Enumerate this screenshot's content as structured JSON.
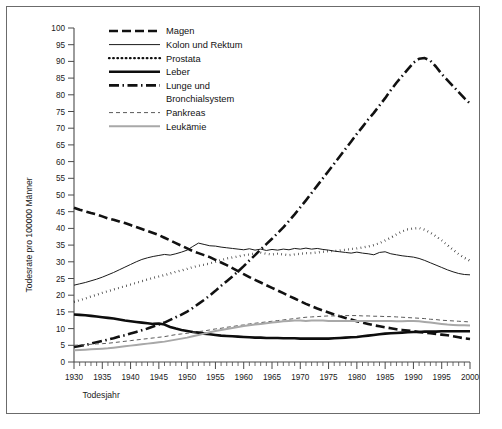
{
  "chart_data": {
    "type": "line",
    "title": "",
    "xlabel": "Todesjahr",
    "ylabel": "Todesrate pro 100000 Männer",
    "xlim": [
      1930,
      2000
    ],
    "ylim": [
      0,
      100
    ],
    "ytick_step": 5,
    "xtick_step": 5,
    "xminor_step": 1,
    "grid": false,
    "legend_position": "top-left-inside",
    "x": [
      1930,
      1931,
      1932,
      1933,
      1934,
      1935,
      1936,
      1937,
      1938,
      1939,
      1940,
      1941,
      1942,
      1943,
      1944,
      1945,
      1946,
      1947,
      1948,
      1949,
      1950,
      1951,
      1952,
      1953,
      1954,
      1955,
      1956,
      1957,
      1958,
      1959,
      1960,
      1961,
      1962,
      1963,
      1964,
      1965,
      1966,
      1967,
      1968,
      1969,
      1970,
      1971,
      1972,
      1973,
      1974,
      1975,
      1976,
      1977,
      1978,
      1979,
      1980,
      1981,
      1982,
      1983,
      1984,
      1985,
      1986,
      1987,
      1988,
      1989,
      1990,
      1991,
      1992,
      1993,
      1994,
      1995,
      1996,
      1997,
      1998,
      1999,
      2000
    ],
    "xticklabels": [
      "1930",
      "1935",
      "1940",
      "1945",
      "1950",
      "1955",
      "1960",
      "1965",
      "1970",
      "1975",
      "1980",
      "1985",
      "1990",
      "1995",
      "2000"
    ],
    "yticklabels": [
      "0",
      "5",
      "10",
      "15",
      "20",
      "25",
      "30",
      "35",
      "40",
      "45",
      "50",
      "55",
      "60",
      "65",
      "70",
      "75",
      "80",
      "85",
      "90",
      "95",
      "100"
    ],
    "series": [
      {
        "name": "Magen",
        "style": "dashed",
        "color": "#111111",
        "width": 2.6,
        "dash": "9,4",
        "values": [
          46.2,
          45.6,
          45.1,
          44.6,
          44.2,
          43.6,
          43.0,
          42.6,
          42.1,
          41.6,
          41.0,
          40.4,
          39.8,
          39.2,
          38.6,
          38.0,
          37.2,
          36.4,
          35.6,
          34.8,
          34.0,
          33.2,
          32.6,
          32.0,
          31.4,
          30.6,
          29.8,
          29.0,
          28.1,
          27.2,
          26.3,
          25.4,
          24.6,
          23.8,
          23.0,
          22.2,
          21.4,
          20.6,
          19.8,
          19.0,
          18.2,
          17.4,
          16.7,
          16.0,
          15.4,
          14.8,
          14.2,
          13.7,
          13.2,
          12.7,
          12.2,
          11.8,
          11.4,
          11.0,
          10.7,
          10.4,
          10.1,
          9.8,
          9.6,
          9.4,
          9.2,
          9.0,
          8.8,
          8.6,
          8.4,
          8.2,
          8.0,
          7.7,
          7.4,
          7.1,
          6.9
        ]
      },
      {
        "name": "Kolon und Rektum",
        "style": "solid-thin",
        "color": "#1a1a1a",
        "width": 1.0,
        "dash": "",
        "values": [
          23.0,
          23.4,
          23.8,
          24.3,
          24.8,
          25.4,
          26.1,
          26.8,
          27.6,
          28.4,
          29.2,
          30.0,
          30.7,
          31.2,
          31.6,
          31.9,
          32.2,
          32.0,
          32.4,
          32.9,
          33.5,
          34.6,
          35.6,
          35.2,
          34.8,
          34.7,
          34.4,
          34.2,
          34.0,
          33.8,
          33.6,
          33.9,
          33.5,
          33.8,
          33.4,
          33.7,
          33.5,
          33.8,
          33.6,
          34.0,
          33.8,
          34.1,
          33.8,
          34.0,
          33.7,
          33.5,
          33.2,
          33.0,
          32.8,
          32.6,
          32.9,
          32.6,
          32.4,
          32.1,
          32.8,
          33.0,
          32.4,
          32.1,
          31.8,
          31.6,
          31.4,
          31.0,
          30.4,
          29.7,
          29.0,
          28.3,
          27.6,
          27.0,
          26.5,
          26.2,
          26.1
        ]
      },
      {
        "name": "Prostata",
        "style": "dotted",
        "color": "#111111",
        "width": 2.3,
        "dash": "0.6,3.6",
        "values": [
          18.0,
          18.5,
          19.0,
          19.6,
          20.1,
          20.7,
          21.2,
          21.7,
          22.2,
          22.7,
          23.2,
          23.7,
          24.2,
          24.7,
          25.2,
          25.6,
          26.0,
          26.5,
          27.0,
          27.4,
          27.9,
          28.4,
          28.8,
          29.1,
          29.5,
          30.0,
          30.5,
          31.0,
          31.3,
          31.6,
          32.0,
          32.2,
          32.5,
          32.7,
          32.4,
          32.2,
          32.4,
          32.2,
          32.0,
          32.2,
          32.4,
          32.6,
          32.6,
          32.8,
          33.0,
          33.2,
          33.2,
          33.4,
          33.6,
          33.8,
          34.0,
          34.3,
          34.6,
          35.0,
          35.6,
          36.4,
          37.2,
          38.2,
          39.1,
          39.7,
          40.0,
          40.1,
          39.6,
          38.7,
          37.6,
          36.4,
          35.0,
          33.6,
          32.3,
          31.2,
          30.3
        ]
      },
      {
        "name": "Leber",
        "style": "solid-thick",
        "color": "#0d0d0d",
        "width": 2.6,
        "dash": "",
        "values": [
          14.2,
          14.1,
          14.0,
          13.8,
          13.6,
          13.4,
          13.2,
          13.0,
          12.7,
          12.4,
          12.2,
          12.0,
          11.8,
          11.6,
          11.4,
          11.5,
          11.2,
          10.5,
          10.0,
          9.6,
          9.3,
          9.0,
          8.8,
          8.5,
          8.3,
          8.1,
          7.9,
          7.8,
          7.7,
          7.6,
          7.5,
          7.4,
          7.3,
          7.3,
          7.2,
          7.2,
          7.2,
          7.1,
          7.1,
          7.1,
          7.0,
          7.0,
          7.0,
          7.0,
          7.0,
          7.0,
          7.1,
          7.2,
          7.3,
          7.4,
          7.5,
          7.7,
          7.9,
          8.1,
          8.3,
          8.5,
          8.6,
          8.7,
          8.8,
          8.9,
          9.0,
          9.0,
          9.1,
          9.1,
          9.1,
          9.2,
          9.2,
          9.2,
          9.2,
          9.2,
          9.2
        ]
      },
      {
        "name": "Lunge und Bronchialsystem",
        "style": "dashdot",
        "color": "#111111",
        "width": 2.6,
        "dash": "10,3.5,1.5,3.5",
        "values": [
          4.5,
          4.8,
          5.1,
          5.5,
          5.9,
          6.3,
          6.7,
          7.1,
          7.6,
          8.0,
          8.5,
          9.0,
          9.5,
          10.0,
          10.6,
          11.2,
          11.8,
          12.6,
          13.4,
          14.2,
          15.1,
          16.2,
          17.4,
          18.6,
          19.9,
          21.3,
          22.8,
          24.2,
          25.6,
          27.1,
          28.7,
          30.4,
          32.0,
          33.7,
          35.3,
          36.9,
          38.6,
          40.3,
          42.2,
          44.2,
          46.3,
          48.4,
          50.6,
          52.8,
          55.0,
          57.2,
          59.4,
          61.6,
          63.8,
          66.0,
          68.3,
          70.4,
          72.6,
          74.6,
          76.8,
          79.0,
          81.4,
          83.6,
          85.6,
          87.6,
          89.6,
          90.8,
          91.0,
          90.2,
          88.4,
          86.2,
          84.4,
          82.6,
          80.8,
          79.0,
          77.4
        ]
      },
      {
        "name": "Pankreas",
        "style": "dashed-thin",
        "color": "#5a5a5a",
        "width": 1.0,
        "dash": "4,3",
        "values": [
          5.0,
          5.1,
          5.2,
          5.3,
          5.4,
          5.5,
          5.6,
          5.8,
          6.0,
          6.2,
          6.4,
          6.6,
          6.8,
          7.0,
          7.2,
          7.4,
          7.6,
          7.9,
          8.2,
          8.4,
          8.6,
          8.9,
          9.1,
          9.3,
          9.6,
          9.9,
          10.1,
          10.4,
          10.6,
          10.9,
          11.1,
          11.4,
          11.6,
          11.8,
          12.0,
          12.2,
          12.4,
          12.6,
          12.8,
          13.0,
          13.2,
          13.4,
          13.5,
          13.6,
          13.7,
          13.8,
          13.8,
          13.9,
          13.9,
          13.9,
          13.9,
          13.8,
          13.8,
          13.7,
          13.7,
          13.6,
          13.6,
          13.5,
          13.4,
          13.3,
          13.2,
          13.1,
          13.0,
          12.8,
          12.7,
          12.5,
          12.4,
          12.3,
          12.2,
          12.1,
          12.0
        ]
      },
      {
        "name": "Leukämie",
        "style": "solid-gray",
        "color": "#a8a8a8",
        "width": 2.0,
        "dash": "",
        "values": [
          3.5,
          3.6,
          3.7,
          3.8,
          3.9,
          4.0,
          4.1,
          4.3,
          4.5,
          4.7,
          4.9,
          5.1,
          5.3,
          5.5,
          5.7,
          5.9,
          6.1,
          6.4,
          6.7,
          7.0,
          7.3,
          7.7,
          8.1,
          8.5,
          8.9,
          9.3,
          9.6,
          9.9,
          10.2,
          10.5,
          10.8,
          11.0,
          11.2,
          11.4,
          11.6,
          11.8,
          12.0,
          12.2,
          12.3,
          12.4,
          12.4,
          12.3,
          12.4,
          12.4,
          12.4,
          12.3,
          12.3,
          12.3,
          12.3,
          12.3,
          12.3,
          12.3,
          12.3,
          12.3,
          12.3,
          12.3,
          12.3,
          12.2,
          12.2,
          12.3,
          12.3,
          12.2,
          12.0,
          11.8,
          11.6,
          11.4,
          11.2,
          11.1,
          11.0,
          11.0,
          10.9
        ]
      }
    ],
    "legend": [
      {
        "label": "Magen",
        "style": "dashed"
      },
      {
        "label": "Kolon und Rektum",
        "style": "solid-thin"
      },
      {
        "label": "Prostata",
        "style": "dotted"
      },
      {
        "label": "Leber",
        "style": "solid-thick"
      },
      {
        "label": "Lunge und",
        "style": "dashdot"
      },
      {
        "label": "Bronchialsystem",
        "style": "none"
      },
      {
        "label": "Pankreas",
        "style": "dashed-thin"
      },
      {
        "label": "Leukämie",
        "style": "solid-gray"
      }
    ]
  }
}
